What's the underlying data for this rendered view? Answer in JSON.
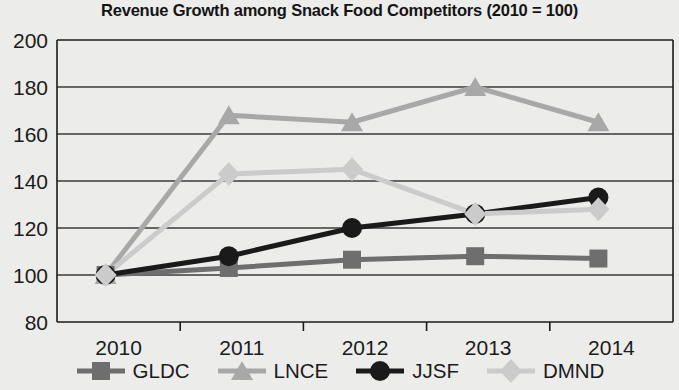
{
  "chart_data": {
    "type": "line",
    "title": "Revenue Growth among Snack Food Competitors (2010 = 100)",
    "xlabel": "",
    "ylabel": "",
    "x": [
      "2010",
      "2011",
      "2012",
      "2013",
      "2014"
    ],
    "categories": [
      "2010",
      "2011",
      "2012",
      "2013",
      "2014"
    ],
    "ylim": [
      80,
      200
    ],
    "yticks": [
      80,
      100,
      120,
      140,
      160,
      180,
      200
    ],
    "ytick_labels": [
      "80",
      "100",
      "120",
      "140",
      "160",
      "180",
      "200"
    ],
    "grid": "horizontal",
    "legend_position": "bottom",
    "series": [
      {
        "name": "GLDC",
        "marker": "square",
        "color": "#6e6e6e",
        "values": [
          100,
          103,
          106.5,
          108,
          107
        ]
      },
      {
        "name": "LNCE",
        "marker": "triangle",
        "color": "#a8a8a8",
        "values": [
          100,
          168,
          165,
          180,
          165
        ]
      },
      {
        "name": "JJSF",
        "marker": "circle",
        "color": "#1a1a1a",
        "values": [
          100,
          108,
          120,
          126,
          133
        ]
      },
      {
        "name": "DMND",
        "marker": "diamond",
        "color": "#cbcbcb",
        "values": [
          100,
          143,
          145,
          126,
          128
        ]
      }
    ]
  },
  "legend": {
    "items": [
      {
        "label": "GLDC",
        "marker": "square",
        "color": "#6e6e6e"
      },
      {
        "label": "LNCE",
        "marker": "triangle",
        "color": "#a8a8a8"
      },
      {
        "label": "JJSF",
        "marker": "circle",
        "color": "#1a1a1a"
      },
      {
        "label": "DMND",
        "marker": "diamond",
        "color": "#cbcbcb"
      }
    ]
  },
  "colors": {
    "background": "#ececeb",
    "axis": "#1b1b1b",
    "grid": "#3a3a3a",
    "title": "#141414"
  }
}
